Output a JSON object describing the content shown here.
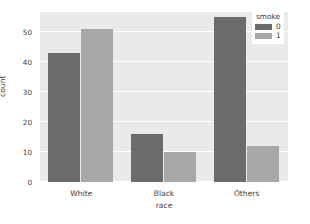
{
  "chart_data": {
    "type": "bar",
    "title": "",
    "subtitle": "",
    "xlabel": "race",
    "ylabel": "count",
    "categories": [
      "White",
      "Black",
      "Others"
    ],
    "series": [
      {
        "name": "0",
        "values": [
          43,
          16,
          55
        ],
        "color": "#6b6b6b"
      },
      {
        "name": "1",
        "values": [
          51,
          10,
          12
        ],
        "color": "#a8a8a8"
      }
    ],
    "legend": {
      "title": "smoke",
      "position": "upper right",
      "entries": [
        {
          "label": "0",
          "color": "#6b6b6b"
        },
        {
          "label": "1",
          "color": "#a8a8a8"
        }
      ]
    },
    "yticks": [
      0,
      10,
      20,
      30,
      40,
      50
    ],
    "ytick_labels": [
      "0",
      "10",
      "20",
      "30",
      "40",
      "50"
    ],
    "ylim": [
      0,
      56.7
    ],
    "xtick_labels": [
      "White",
      "Black",
      "Others"
    ],
    "grid": true,
    "grid_axis": "y",
    "grid_color": "#ffffff",
    "plot_background": "#eaeaea",
    "figure_background": "#ffffff",
    "style": "seaborn-darkgrid",
    "bar_groups": [
      {
        "category": "White",
        "bars": [
          {
            "series": "0",
            "value": 43
          },
          {
            "series": "1",
            "value": 51
          }
        ]
      },
      {
        "category": "Black",
        "bars": [
          {
            "series": "0",
            "value": 16
          },
          {
            "series": "1",
            "value": 10
          }
        ]
      },
      {
        "category": "Others",
        "bars": [
          {
            "series": "0",
            "value": 55
          },
          {
            "series": "1",
            "value": 12
          }
        ]
      }
    ]
  }
}
